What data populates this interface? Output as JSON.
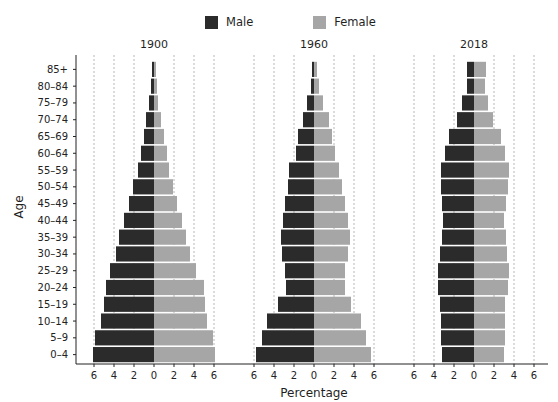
{
  "legend": {
    "items": [
      {
        "label": "Male",
        "color": "#2b2b2b"
      },
      {
        "label": "Female",
        "color": "#a6a6a6"
      }
    ]
  },
  "axes": {
    "ylabel": "Age",
    "xlabel": "Percentage"
  },
  "chart_data": {
    "type": "bar",
    "subtype": "population-pyramid",
    "title": "",
    "xlabel": "Percentage",
    "ylabel": "Age",
    "xlim": [
      -7,
      7
    ],
    "xticks": [
      6,
      4,
      2,
      0,
      2,
      4,
      6
    ],
    "grid": "vertical dashed at ±2, ±4, ±6",
    "legend_position": "top-center",
    "categories": [
      "0–4",
      "5–9",
      "10–14",
      "15–19",
      "20–24",
      "25–29",
      "30–34",
      "35–39",
      "40–44",
      "45–49",
      "50–54",
      "55–59",
      "60–64",
      "65–69",
      "70–74",
      "75–79",
      "80–84",
      "85+"
    ],
    "panels": [
      {
        "title": "1900",
        "series": [
          {
            "name": "Male",
            "values": [
              6.1,
              5.9,
              5.3,
              5.0,
              4.8,
              4.4,
              3.8,
              3.5,
              3.0,
              2.5,
              2.1,
              1.6,
              1.3,
              1.0,
              0.8,
              0.5,
              0.3,
              0.2
            ]
          },
          {
            "name": "Female",
            "values": [
              6.1,
              5.9,
              5.3,
              5.1,
              5.0,
              4.2,
              3.6,
              3.2,
              2.8,
              2.3,
              1.9,
              1.5,
              1.3,
              1.0,
              0.7,
              0.4,
              0.3,
              0.2
            ]
          }
        ]
      },
      {
        "title": "1960",
        "series": [
          {
            "name": "Male",
            "values": [
              5.8,
              5.2,
              4.7,
              3.6,
              2.8,
              2.9,
              3.2,
              3.3,
              3.1,
              2.9,
              2.6,
              2.5,
              1.8,
              1.6,
              1.1,
              0.7,
              0.3,
              0.2
            ]
          },
          {
            "name": "Female",
            "values": [
              5.7,
              5.2,
              4.7,
              3.7,
              3.1,
              3.1,
              3.4,
              3.6,
              3.4,
              3.1,
              2.8,
              2.5,
              2.1,
              1.8,
              1.5,
              0.9,
              0.5,
              0.3
            ]
          }
        ]
      },
      {
        "title": "2018",
        "series": [
          {
            "name": "Male",
            "values": [
              3.2,
              3.3,
              3.3,
              3.4,
              3.6,
              3.6,
              3.4,
              3.2,
              3.1,
              3.2,
              3.3,
              3.3,
              2.9,
              2.5,
              1.7,
              1.2,
              0.7,
              0.7
            ]
          },
          {
            "name": "Female",
            "values": [
              3.0,
              3.1,
              3.1,
              3.1,
              3.4,
              3.5,
              3.3,
              3.2,
              3.0,
              3.2,
              3.4,
              3.5,
              3.1,
              2.7,
              1.9,
              1.4,
              1.1,
              1.2
            ]
          }
        ]
      }
    ]
  }
}
